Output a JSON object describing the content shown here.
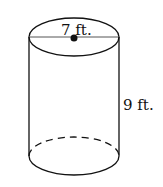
{
  "figure": {
    "shape": "cylinder",
    "diameter_label": "7 ft.",
    "height_label": "9 ft.",
    "stroke_color": "#111111",
    "background": "#ffffff"
  }
}
